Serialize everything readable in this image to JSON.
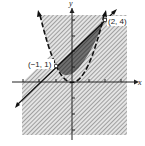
{
  "figure": {
    "type": "system-of-inequalities-graph",
    "axes": {
      "x_label": "x",
      "y_label": "y"
    },
    "curves": [
      {
        "name": "parabola",
        "equation": "y = x^2",
        "style": "dashed"
      },
      {
        "name": "line",
        "equation": "y = x + 2",
        "style": "solid"
      }
    ],
    "points": [
      {
        "label": "(-1, 1)",
        "x": -1,
        "y": 1
      },
      {
        "label": "(2, 4)",
        "x": 2,
        "y": 4
      }
    ],
    "regions": [
      {
        "name": "above-parabola",
        "shading": "light-hatch"
      },
      {
        "name": "below-line",
        "shading": "light-hatch"
      },
      {
        "name": "intersection",
        "shading": "dark-hatch"
      }
    ],
    "colors": {
      "ink": "#222222",
      "hatch": "#8a8a8a",
      "dark_fill": "#5a5a5a",
      "background": "#ffffff"
    }
  },
  "labels": {
    "x_axis": "x",
    "y_axis": "y",
    "point_a": "(−1, 1)",
    "point_b": "(2, 4)"
  }
}
